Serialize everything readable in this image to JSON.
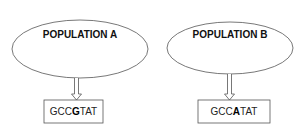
{
  "populations": [
    {
      "label": "POPULATION A",
      "sequence": {
        "prefix": "GCC",
        "highlight": "G",
        "suffix": "TAT"
      }
    },
    {
      "label": "POPULATION B",
      "sequence": {
        "prefix": "GCC",
        "highlight": "A",
        "suffix": "TAT"
      }
    }
  ],
  "colors": {
    "stroke": "#555555",
    "text": "#111111"
  }
}
